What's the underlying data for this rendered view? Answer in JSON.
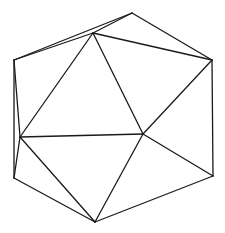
{
  "figure": {
    "stroke_color": "#1a1a1a",
    "background": "#ffffff",
    "vertices": {
      "A": [
        132,
        13
      ],
      "B": [
        93,
        33
      ],
      "C": [
        14,
        60
      ],
      "D": [
        212,
        60
      ],
      "E": [
        20,
        137
      ],
      "F": [
        143,
        134
      ],
      "G": [
        14,
        178
      ],
      "H": [
        213,
        176
      ],
      "I": [
        95,
        222
      ]
    },
    "edges": [
      [
        "A",
        "C"
      ],
      [
        "B",
        "C"
      ],
      [
        "A",
        "B"
      ],
      [
        "A",
        "D"
      ],
      [
        "B",
        "D"
      ],
      [
        "B",
        "E"
      ],
      [
        "B",
        "F"
      ],
      [
        "C",
        "E"
      ],
      [
        "C",
        "G"
      ],
      [
        "E",
        "G"
      ],
      [
        "D",
        "F"
      ],
      [
        "D",
        "H"
      ],
      [
        "E",
        "F"
      ],
      [
        "E",
        "I"
      ],
      [
        "F",
        "I"
      ],
      [
        "F",
        "H"
      ],
      [
        "G",
        "I"
      ],
      [
        "H",
        "I"
      ]
    ]
  }
}
